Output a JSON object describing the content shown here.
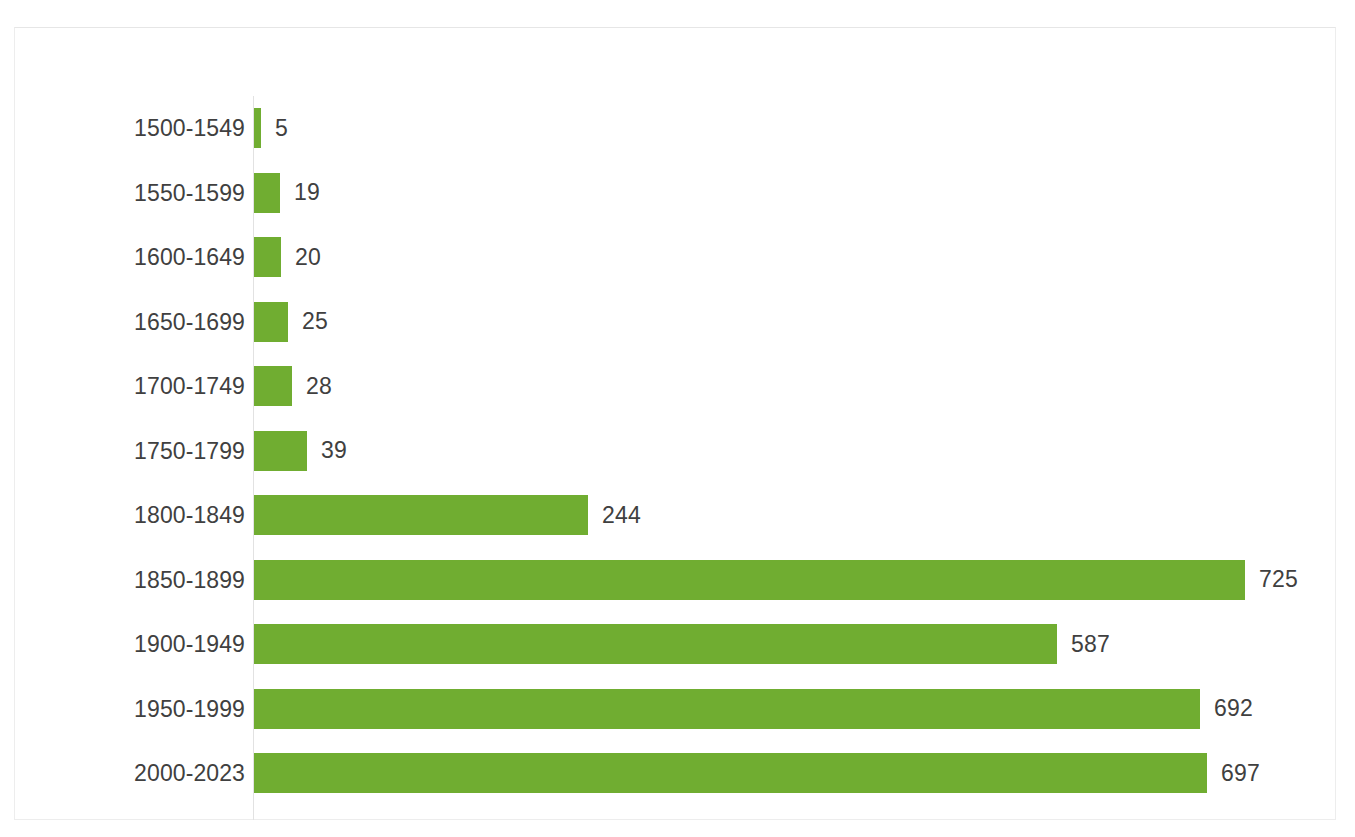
{
  "chart_data": {
    "type": "bar",
    "orientation": "horizontal",
    "title": "",
    "subtitle": "",
    "xlabel": "",
    "ylabel": "",
    "grid": false,
    "legend": false,
    "legend_position": "none",
    "axis_line": true,
    "xlim": [
      0,
      780
    ],
    "bar_color": "#70AD31",
    "label_color": "#404040",
    "background_color": "#FFFFFF",
    "frame_color": "#EDEDED",
    "categories": [
      "1500-1549",
      "1550-1599",
      "1600-1649",
      "1650-1699",
      "1700-1749",
      "1750-1799",
      "1800-1849",
      "1850-1899",
      "1900-1949",
      "1950-1999",
      "2000-2023"
    ],
    "values": [
      5,
      19,
      20,
      25,
      28,
      39,
      244,
      725,
      587,
      692,
      697
    ],
    "data_labels": [
      "5",
      "19",
      "20",
      "25",
      "28",
      "39",
      "244",
      "725",
      "587",
      "692",
      "697"
    ],
    "points": [
      {
        "category": "1500-1549",
        "value": 5,
        "label": "5"
      },
      {
        "category": "1550-1599",
        "value": 19,
        "label": "19"
      },
      {
        "category": "1600-1649",
        "value": 20,
        "label": "20"
      },
      {
        "category": "1650-1699",
        "value": 25,
        "label": "25"
      },
      {
        "category": "1700-1749",
        "value": 28,
        "label": "28"
      },
      {
        "category": "1750-1799",
        "value": 39,
        "label": "39"
      },
      {
        "category": "1800-1849",
        "value": 244,
        "label": "244"
      },
      {
        "category": "1850-1899",
        "value": 725,
        "label": "725"
      },
      {
        "category": "1900-1949",
        "value": 587,
        "label": "587"
      },
      {
        "category": "1950-1999",
        "value": 692,
        "label": "692"
      },
      {
        "category": "2000-2023",
        "value": 697,
        "label": "697"
      }
    ]
  }
}
